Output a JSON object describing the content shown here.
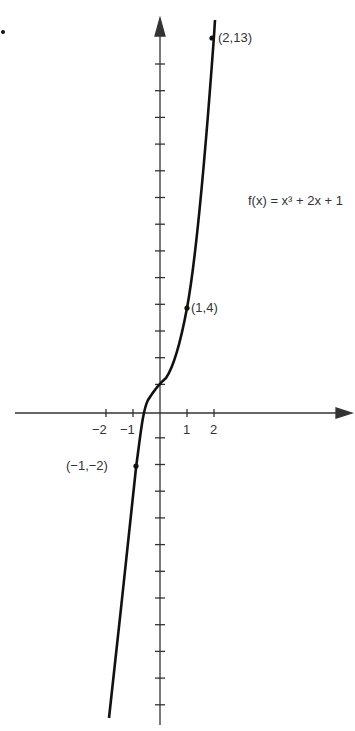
{
  "chart_data": {
    "type": "line",
    "title": "",
    "function_label": "f(x) = x³ + 2x + 1",
    "xlabel": "",
    "ylabel": "",
    "x_tick_labels": [
      "−2",
      "−1",
      "1",
      "2"
    ],
    "labeled_points": [
      {
        "x": -1,
        "y": -2,
        "label": "(−1,−2)"
      },
      {
        "x": 1,
        "y": 4,
        "label": "(1,4)"
      },
      {
        "x": 2,
        "y": 13,
        "label": "(2,13)"
      }
    ],
    "series": [
      {
        "name": "f(x)",
        "x": [
          -1.6,
          -1,
          -0.5,
          0,
          0.5,
          1,
          1.5,
          2,
          2.1
        ],
        "y": [
          -6.3,
          -2,
          -0.125,
          1,
          2.125,
          4,
          7.375,
          13,
          14.46
        ]
      }
    ],
    "xlim": [
      -5.5,
      7
    ],
    "ylim": [
      -16,
      16
    ],
    "grid": false
  },
  "bullet": "."
}
